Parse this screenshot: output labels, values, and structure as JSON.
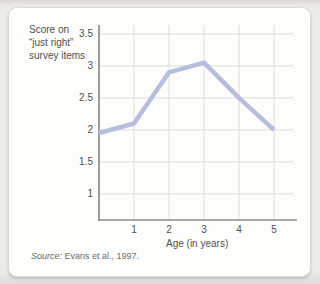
{
  "figure": {
    "ylabel_lines": [
      "Score on",
      "“just right”",
      "survey items"
    ],
    "xlabel": "Age (in years)",
    "source_label": "Source:",
    "source_rest": " Evans et al., 1997."
  },
  "chart_data": {
    "type": "line",
    "title": "",
    "xlabel": "Age (in years)",
    "ylabel": "Score on “just right” survey items",
    "x": [
      0,
      1,
      2,
      3,
      4,
      5
    ],
    "values": [
      1.95,
      2.1,
      2.9,
      3.05,
      2.5,
      2.0
    ],
    "series_name": "Score on “just right” survey items",
    "xticks": [
      1,
      2,
      3,
      4,
      5
    ],
    "xtick_labels": [
      "1",
      "2",
      "3",
      "4",
      "5"
    ],
    "yticks": [
      3.5,
      3,
      2.5,
      2,
      1.5,
      1
    ],
    "ytick_labels": [
      "3.5",
      "3",
      "2.5",
      "2",
      "1.5",
      "1"
    ],
    "x_axis_range": [
      0,
      5.57
    ],
    "y_axis_range": [
      0.59,
      3.64
    ],
    "grid": true,
    "legend_position": "none",
    "source": "Source: Evans et al., 1997.",
    "colors": {
      "line": "#b6bede",
      "grid": "#dcdcda",
      "axis": "#8c8c8a",
      "text": "#515151",
      "source_text": "#6d6d6b",
      "card_bg": "#fdfdfb",
      "page_bg": "#ecebe7",
      "card_border": "#dbd9d3"
    }
  }
}
